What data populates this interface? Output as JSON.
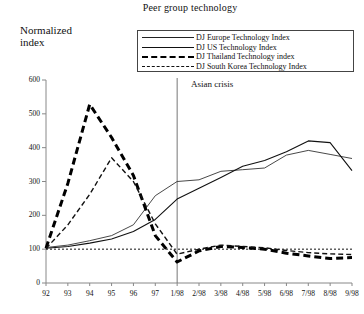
{
  "chart": {
    "title": "Peer group technology",
    "y_axis_title_line1": "Normalized",
    "y_axis_title_line2": "index",
    "annotation": "Asian crisis"
  },
  "legend": {
    "items": [
      {
        "label": "DJ Europe Technology Index",
        "style": "solid-thin",
        "name": "legend-europe"
      },
      {
        "label": "DJ US Technology Index",
        "style": "solid-thin2",
        "name": "legend-us"
      },
      {
        "label": "DJ Thailand Technology index",
        "style": "dash-thick",
        "name": "legend-thailand"
      },
      {
        "label": "DJ South Korea Technology Index",
        "style": "dash-thin",
        "name": "legend-korea"
      }
    ]
  },
  "chart_data": {
    "type": "line",
    "title": "Peer group technology",
    "xlabel": "",
    "ylabel": "Normalized index",
    "ylim": [
      0,
      600
    ],
    "yticks": [
      0,
      100,
      200,
      300,
      400,
      500,
      600
    ],
    "grid": false,
    "legend_position": "top",
    "categories": [
      "92",
      "93",
      "94",
      "95",
      "96",
      "97",
      "1/98",
      "2/98",
      "3/98",
      "4/98",
      "5/98",
      "6/98",
      "7/98",
      "8/98",
      "9/98"
    ],
    "reference_lines": [
      {
        "type": "horizontal",
        "value": 100,
        "style": "dotted",
        "label": ""
      },
      {
        "type": "vertical",
        "at": "1/98",
        "style": "solid",
        "label": "Asian crisis"
      }
    ],
    "series": [
      {
        "name": "DJ Europe Technology Index",
        "style": "solid-thin",
        "values": [
          105,
          112,
          125,
          140,
          172,
          258,
          300,
          305,
          330,
          335,
          340,
          378,
          392,
          380,
          368
        ]
      },
      {
        "name": "DJ US Technology Index",
        "style": "solid-thin2",
        "values": [
          103,
          108,
          118,
          130,
          152,
          188,
          248,
          280,
          312,
          345,
          362,
          388,
          420,
          415,
          332
        ]
      },
      {
        "name": "DJ Thailand Technology index",
        "style": "dash-thick",
        "values": [
          103,
          295,
          528,
          430,
          318,
          140,
          62,
          95,
          108,
          105,
          100,
          88,
          80,
          72,
          75
        ]
      },
      {
        "name": "DJ South Korea Technology Index",
        "style": "dash-thin",
        "values": [
          102,
          172,
          262,
          370,
          300,
          175,
          85,
          100,
          112,
          108,
          104,
          96,
          90,
          86,
          84
        ]
      }
    ]
  },
  "axes": {
    "y_labels": [
      "600",
      "500",
      "400",
      "300",
      "200",
      "100",
      "0"
    ],
    "x_labels": [
      "92",
      "93",
      "94",
      "95",
      "96",
      "97",
      "1/98",
      "2/98",
      "3/98",
      "4/98",
      "5/98",
      "6/98",
      "7/98",
      "8/98",
      "9/98"
    ]
  }
}
